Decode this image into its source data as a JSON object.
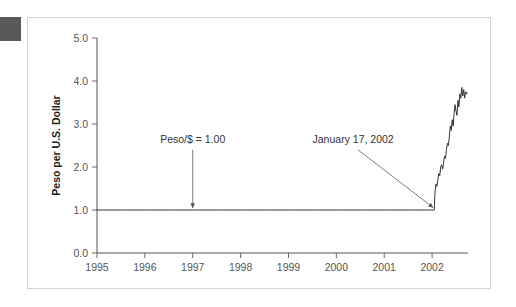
{
  "figure": {
    "background_color": "#ffffff",
    "frame_color": "#d3d3d3",
    "corner_marker_color": "#595959"
  },
  "chart_data": {
    "type": "line",
    "title": "",
    "subtitle": "",
    "xlabel": "",
    "ylabel": "Peso per U.S. Dollar",
    "xlim": [
      1995.0,
      2002.75
    ],
    "ylim": [
      0.0,
      5.0
    ],
    "grid": false,
    "legend_position": "none",
    "y_ticks": [
      "0.0",
      "1.0",
      "2.0",
      "3.0",
      "4.0",
      "5.0"
    ],
    "y_tick_values": [
      0.0,
      1.0,
      2.0,
      3.0,
      4.0,
      5.0
    ],
    "x_ticks": [
      "1995",
      "1996",
      "1997",
      "1998",
      "1999",
      "2000",
      "2001",
      "2002"
    ],
    "x_tick_values": [
      1995,
      1996,
      1997,
      1998,
      1999,
      2000,
      2001,
      2002
    ],
    "series": [
      {
        "name": "Argentine Peso per U.S. Dollar",
        "line_color": "#333333",
        "x": [
          1995.0,
          1995.5,
          1996.0,
          1996.5,
          1997.0,
          1997.5,
          1998.0,
          1998.5,
          1999.0,
          1999.5,
          2000.0,
          2000.5,
          2001.0,
          2001.5,
          2001.9,
          2002.045,
          2002.06,
          2002.08,
          2002.1,
          2002.12,
          2002.14,
          2002.16,
          2002.18,
          2002.2,
          2002.22,
          2002.24,
          2002.26,
          2002.28,
          2002.3,
          2002.32,
          2002.34,
          2002.36,
          2002.38,
          2002.4,
          2002.42,
          2002.44,
          2002.46,
          2002.48,
          2002.5,
          2002.52,
          2002.54,
          2002.56,
          2002.58,
          2002.6,
          2002.62,
          2002.64,
          2002.66,
          2002.68,
          2002.7,
          2002.72,
          2002.74
        ],
        "y": [
          1.0,
          1.0,
          1.0,
          1.0,
          1.0,
          1.0,
          1.0,
          1.0,
          1.0,
          1.0,
          1.0,
          1.0,
          1.0,
          1.0,
          1.0,
          1.0,
          1.4,
          1.6,
          1.55,
          1.7,
          1.85,
          1.8,
          2.0,
          2.05,
          1.95,
          2.1,
          2.25,
          2.2,
          2.4,
          2.55,
          2.5,
          2.7,
          2.95,
          2.85,
          3.1,
          2.95,
          3.25,
          3.45,
          3.3,
          3.2,
          3.55,
          3.4,
          3.7,
          3.6,
          3.85,
          3.65,
          3.8,
          3.6,
          3.75,
          3.7,
          3.72
        ]
      }
    ],
    "annotations": [
      {
        "id": "peso-parity",
        "text": "Peso/$ = 1.00",
        "text_x": 1997.0,
        "text_y": 2.55,
        "arrow_from_x": 1997.0,
        "arrow_from_y": 2.4,
        "arrow_to_x": 1997.0,
        "arrow_to_y": 1.05
      },
      {
        "id": "devaluation-date",
        "text": "January 17, 2002",
        "text_x": 2000.35,
        "text_y": 2.55,
        "arrow_from_x": 2000.45,
        "arrow_from_y": 2.4,
        "arrow_to_x": 2002.02,
        "arrow_to_y": 1.06
      }
    ]
  }
}
